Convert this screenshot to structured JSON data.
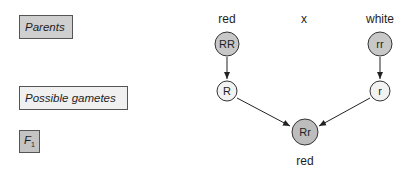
{
  "generation_labels": {
    "parents": "Parents",
    "gametes": "Possible gametes",
    "f1_letter": "F",
    "f1_subscript": "1"
  },
  "cross": {
    "parent1": {
      "phenotype": "red",
      "genotype": "RR",
      "gamete": "R"
    },
    "cross_symbol": "x",
    "parent2": {
      "phenotype": "white",
      "genotype": "rr",
      "gamete": "r"
    },
    "offspring": {
      "genotype": "Rr",
      "phenotype": "red"
    }
  },
  "colors": {
    "parent_fill": "#c8c8c8",
    "gamete_fill": "#f2f2f2",
    "offspring_fill": "#bdbdbd",
    "stroke": "#333333"
  }
}
